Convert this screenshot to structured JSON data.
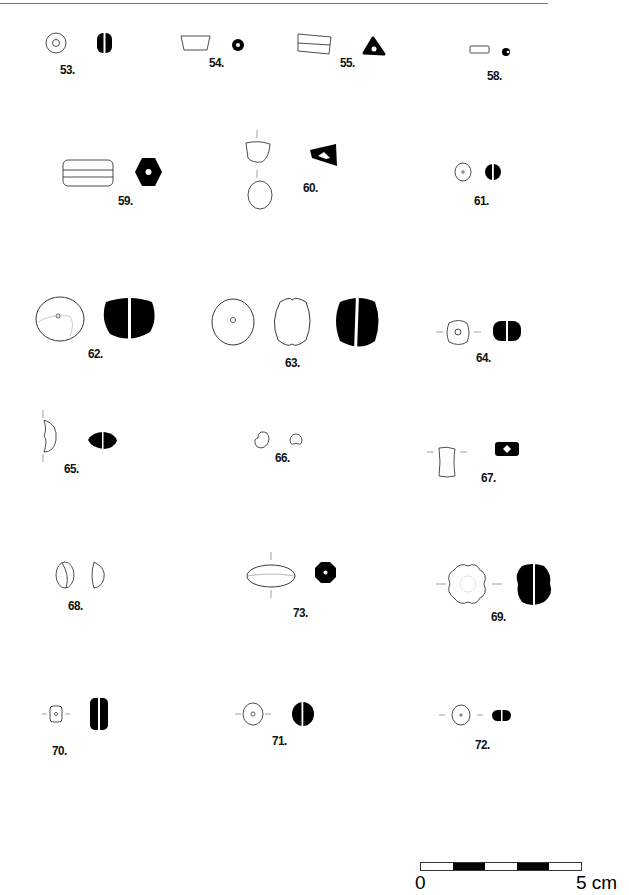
{
  "plate": {
    "labels": {
      "n53": "53.",
      "n54": "54.",
      "n55": "55.",
      "n58": "58.",
      "n59": "59.",
      "n60": "60.",
      "n61": "61.",
      "n62": "62.",
      "n63": "63.",
      "n64": "64.",
      "n65": "65.",
      "n66": "66.",
      "n67": "67.",
      "n68": "68.",
      "n73": "73.",
      "n69": "69.",
      "n70": "70.",
      "n71": "71.",
      "n72": "72."
    }
  },
  "scale_bar": {
    "start_label": "0",
    "end_label": "5 cm",
    "segments": 5
  }
}
